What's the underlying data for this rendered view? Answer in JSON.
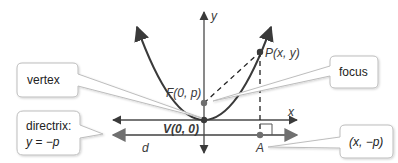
{
  "diagram": {
    "colors": {
      "curve": "#3a3a3a",
      "axis": "#4a4a4a",
      "directrix": "#707070",
      "point_focus": "#6e6e6e",
      "callout_border": "#bdbdbd",
      "callout_fill": "#ffffff"
    },
    "axes": {
      "x_label": "x",
      "y_label": "y"
    },
    "points": {
      "vertex": "V(0, 0)",
      "focus": "F(0, p)",
      "point_p": "P(x, y)",
      "point_a": "A"
    },
    "distance_label": "d",
    "callouts": {
      "vertex": "vertex",
      "directrix_line1": "directrix:",
      "directrix_line2": "y = −p",
      "focus": "focus",
      "a_coords": "(x, −p)"
    }
  }
}
